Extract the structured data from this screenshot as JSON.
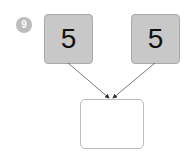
{
  "problem": {
    "number": "9"
  },
  "number_bond": {
    "parts": [
      {
        "label": "5"
      },
      {
        "label": "5"
      }
    ],
    "whole": {
      "label": ""
    }
  },
  "colors": {
    "badge": "#bcbcbc",
    "part_fill": "#c8c8c8",
    "part_border": "#a9a9a9",
    "whole_border": "#bdbdbd",
    "arrow": "#333333"
  }
}
